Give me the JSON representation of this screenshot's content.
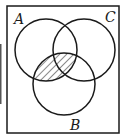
{
  "diagram": {
    "type": "venn",
    "sets": [
      {
        "id": "A",
        "label": "A"
      },
      {
        "id": "C",
        "label": "C"
      },
      {
        "id": "B",
        "label": "B"
      }
    ],
    "shaded_region": "A ∩ B",
    "shading_style": "diagonal hatch",
    "colors": {
      "stroke": "#1a1a1a",
      "background": "#ffffff"
    }
  }
}
